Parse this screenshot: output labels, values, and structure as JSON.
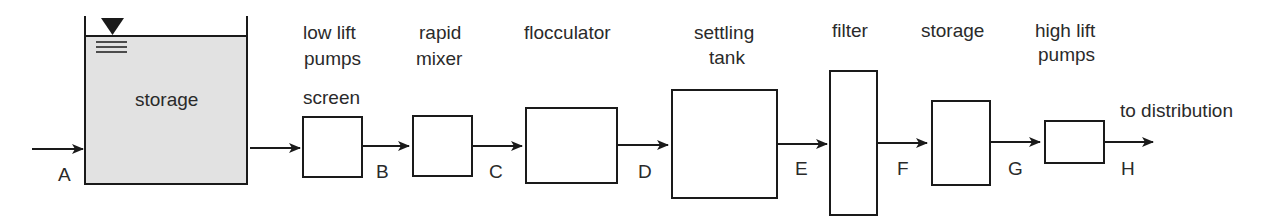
{
  "diagram": {
    "type": "process-flow",
    "units": [
      {
        "id": "storage-reservoir",
        "label": "storage"
      },
      {
        "id": "low-lift-pumps",
        "label_line1": "low lift",
        "label_line2": "pumps",
        "label_line3": "screen"
      },
      {
        "id": "rapid-mixer",
        "label_line1": "rapid",
        "label_line2": "mixer"
      },
      {
        "id": "flocculator",
        "label": "flocculator"
      },
      {
        "id": "settling-tank",
        "label_line1": "settling",
        "label_line2": "tank"
      },
      {
        "id": "filter",
        "label": "filter"
      },
      {
        "id": "storage-clearwell",
        "label": "storage"
      },
      {
        "id": "high-lift-pumps",
        "label_line1": "high lift",
        "label_line2": "pumps"
      }
    ],
    "points": [
      "A",
      "B",
      "C",
      "D",
      "E",
      "F",
      "G",
      "H"
    ],
    "outlet_label": "to distribution",
    "colors": {
      "line": "#1a1a1a",
      "tank_fill": "#e2e2e2"
    }
  }
}
